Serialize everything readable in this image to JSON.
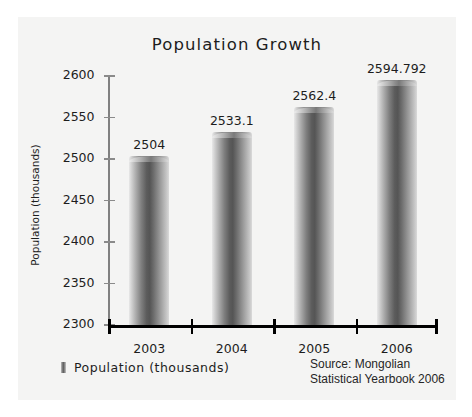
{
  "chart_data": {
    "type": "bar",
    "title": "Population Growth",
    "xlabel": "",
    "ylabel": "Population (thousands)",
    "categories": [
      "2003",
      "2004",
      "2005",
      "2006"
    ],
    "values": [
      2504,
      2533.1,
      2562.4,
      2594.792
    ],
    "value_labels": [
      "2504",
      "2533.1",
      "2562.4",
      "2594.792"
    ],
    "ylim": [
      2300,
      2600
    ],
    "yticks": [
      2300,
      2350,
      2400,
      2450,
      2500,
      2550,
      2600
    ],
    "ytick_labels": [
      "2300",
      "2350",
      "2400",
      "2450",
      "2500",
      "2550",
      "2600"
    ],
    "grid": false,
    "legend_position": "bottom-left",
    "series": [
      {
        "name": "Population (thousands)",
        "values": [
          2504,
          2533.1,
          2562.4,
          2594.792
        ]
      }
    ],
    "annotations": [
      "Source: Mongolian",
      "Statistical Yearbook 2006"
    ]
  },
  "legend": {
    "label": "Population  (thousands)",
    "swatch_name": "gradient-bar-swatch"
  },
  "source": {
    "line1": "Source: Mongolian",
    "line2": "Statistical Yearbook 2006"
  },
  "colors": {
    "page_background": "#ffffff",
    "panel_background": "#f4f4f3",
    "text": "#1d1d1d",
    "axis_y": "#808080",
    "axis_x": "#000000",
    "bar_dark": "#555555",
    "bar_light": "#e8e8e8"
  }
}
